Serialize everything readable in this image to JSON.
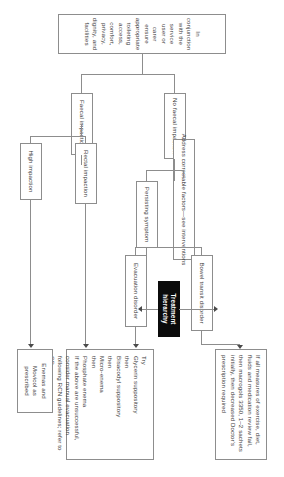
{
  "diagram": {
    "orientation": "rotated-90",
    "accent_dark": "#0b0b0b",
    "line_color": "#8d8d8d",
    "text_color": "#3a3a3a"
  },
  "nodes": {
    "root": {
      "label": "In conjunction with the service user or carer ensure appropriate toileting access, comfort, privacy, dignity, and facilities"
    },
    "no_faecal_impaction": {
      "label": "No faecal impaction"
    },
    "faecal_impaction": {
      "label": "Faecal impaction"
    },
    "address_factors": {
      "label": "Address correctable factors—see interventions"
    },
    "persisting_symptom": {
      "label": "Persisting symptom"
    },
    "rectal_impaction": {
      "label": "Rectal impaction"
    },
    "high_impaction": {
      "label": "High impaction"
    },
    "bowel_transit_disorder": {
      "label": "Bowel transit disorder"
    },
    "evacuation_disorder": {
      "label": "Evacuation disorder"
    },
    "treatment_hierarchy": {
      "label": "Treatment hierarchy"
    },
    "macrogol_box": {
      "label": "If all measures of exercise, diet, fluids and medication review fail, then macrogols 3350, 1–2 sachets initially, then decreased Doctor's prescription required"
    },
    "enemas_movicol": {
      "label": "Enemas and Movicol as prescribed"
    },
    "treatment_steps": {
      "lines": [
        "Try",
        "Glycerin suppository",
        "then",
        "Bisacodyl suppository",
        "then",
        "Micro-enema",
        "then",
        "Phosphate enema"
      ],
      "footer": "If the above are unsuccessful, consider manual evacuation following RCN guidelines; refer to GP"
    }
  }
}
